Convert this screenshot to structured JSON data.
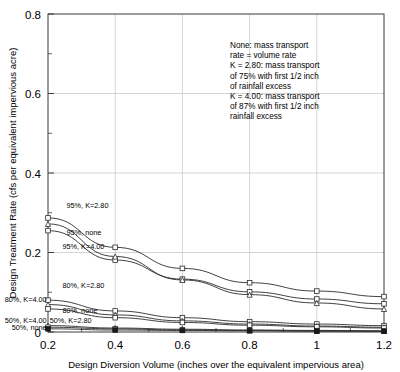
{
  "chart_data": {
    "type": "line",
    "title": "",
    "xlabel": "Design Diversion Volume (inches over the equivalent impervious area)",
    "ylabel": "Design Treatment Rate (cfs per equivalent impervious acre)",
    "xlim": [
      0.2,
      1.2
    ],
    "ylim": [
      0.0,
      0.8
    ],
    "xticks": [
      0.2,
      0.4,
      0.6,
      0.8,
      1.0,
      1.2
    ],
    "xticklabels": [
      "0.2",
      "0.4",
      "0.6",
      "0.8",
      "1",
      "1.2"
    ],
    "yticks": [
      0.0,
      0.2,
      0.4,
      0.6,
      0.8
    ],
    "yticklabels": [
      "0",
      "0.2",
      "0.4",
      "0.6",
      "0.8"
    ],
    "yminorticks": [
      0.1,
      0.3,
      0.5,
      0.7
    ],
    "grid": "both",
    "legend_position": "inline-labels",
    "x": [
      0.2,
      0.4,
      0.6,
      0.8,
      1.0,
      1.2
    ],
    "series": [
      {
        "name": "95%, K=2.80",
        "marker": "square",
        "values": [
          0.287,
          0.213,
          0.16,
          0.124,
          0.103,
          0.089
        ]
      },
      {
        "name": "95%, none",
        "marker": "square",
        "values": [
          0.255,
          0.181,
          0.133,
          0.101,
          0.083,
          0.071
        ]
      },
      {
        "name": "95%, K=4.00",
        "marker": "triangle",
        "values": [
          0.272,
          0.19,
          0.131,
          0.094,
          0.073,
          0.058
        ]
      },
      {
        "name": "80%, K=2.80",
        "marker": "square",
        "values": [
          0.08,
          0.053,
          0.036,
          0.026,
          0.02,
          0.016
        ]
      },
      {
        "name": "80%, K=4.00",
        "marker": "triangle",
        "values": [
          0.069,
          0.043,
          0.028,
          0.02,
          0.015,
          0.012
        ]
      },
      {
        "name": "80%, none",
        "marker": "square",
        "values": [
          0.058,
          0.036,
          0.024,
          0.017,
          0.013,
          0.01
        ]
      },
      {
        "name": "50%, K=4.00",
        "marker": "triangle",
        "values": [
          0.016,
          0.01,
          0.007,
          0.005,
          0.004,
          0.003
        ]
      },
      {
        "name": "50%, K=2.80",
        "marker": "square",
        "values": [
          0.012,
          0.008,
          0.005,
          0.004,
          0.003,
          0.002
        ]
      },
      {
        "name": "50%, none",
        "marker": "square-solid",
        "values": [
          0.008,
          0.005,
          0.004,
          0.003,
          0.002,
          0.002
        ]
      }
    ],
    "curve_labels": [
      {
        "text": "95%, K=2.80",
        "x": 0.255,
        "y": 0.318,
        "anchor": "start"
      },
      {
        "text": "95%, none",
        "x": 0.255,
        "y": 0.25,
        "anchor": "start"
      },
      {
        "text": "95%, K=4.00",
        "x": 0.243,
        "y": 0.214,
        "anchor": "start"
      },
      {
        "text": "80%, K=2.80",
        "x": 0.243,
        "y": 0.117,
        "anchor": "start"
      },
      {
        "text": "80%, K=4.00",
        "x": 0.196,
        "y": 0.082,
        "anchor": "end"
      },
      {
        "text": "80%, none",
        "x": 0.243,
        "y": 0.055,
        "anchor": "start"
      },
      {
        "text": "50%, K=4.00",
        "x": 0.196,
        "y": 0.03,
        "anchor": "end"
      },
      {
        "text": "50%, K=2.80",
        "x": 0.205,
        "y": 0.03,
        "anchor": "start"
      },
      {
        "text": "50%, none",
        "x": 0.196,
        "y": 0.012,
        "anchor": "end"
      }
    ],
    "annotation_lines": [
      "None: mass transport",
      "  rate = volume rate",
      "K = 2.80: mass transport",
      "  of 75% with first 1/2 inch",
      "  of rainfall excess",
      "K = 4.00: mass transport",
      "  of 87% with first 1/2 inch",
      "  rainfall excess"
    ]
  },
  "colors": {
    "axis": "#3a3a3a",
    "grid": "#c9c9c9",
    "curve": "#2b2b2b",
    "background": "#ffffff",
    "text": "#000000"
  }
}
